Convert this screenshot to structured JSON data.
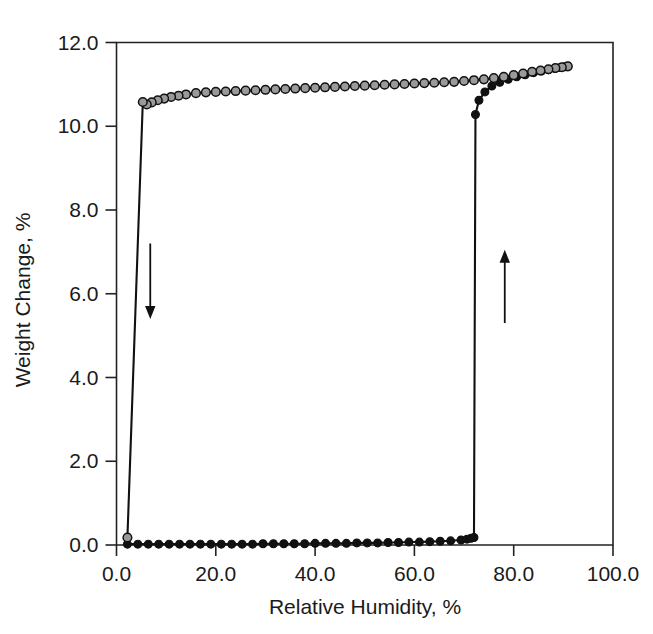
{
  "chart_data": {
    "type": "line",
    "title": "",
    "xlabel": "Relative Humidity, %",
    "ylabel": "Weight Change, %",
    "xlim": [
      0.0,
      100.0
    ],
    "ylim": [
      0.0,
      12.0
    ],
    "xticks": [
      "0.0",
      "20.0",
      "40.0",
      "60.0",
      "80.0",
      "100.0"
    ],
    "xtick_values": [
      0,
      20,
      40,
      60,
      80,
      100
    ],
    "yticks": [
      "0.0",
      "2.0",
      "4.0",
      "6.0",
      "8.0",
      "10.0",
      "12.0"
    ],
    "ytick_values": [
      0,
      2,
      4,
      6,
      8,
      10,
      12
    ],
    "grid": false,
    "legend": "none",
    "series": [
      {
        "name": "Adsorption",
        "marker": "filled-circle",
        "marker_color": "#111111",
        "line_color": "#111111",
        "x": [
          2.2,
          4.3,
          6.4,
          8.5,
          10.6,
          12.7,
          14.8,
          16.9,
          19.0,
          21.1,
          23.2,
          25.3,
          27.4,
          29.5,
          31.6,
          33.7,
          35.8,
          37.9,
          40.0,
          42.1,
          44.2,
          46.3,
          48.4,
          50.5,
          52.6,
          54.7,
          56.8,
          58.9,
          61.0,
          63.1,
          65.2,
          67.3,
          69.4,
          70.6,
          71.4,
          72.0,
          72.3,
          73.0,
          74.2,
          75.6,
          77.2,
          78.9,
          80.6,
          82.3,
          84.0,
          85.6,
          87.0,
          88.3,
          89.4,
          90.3,
          90.9
        ],
        "y": [
          0.02,
          0.02,
          0.02,
          0.02,
          0.02,
          0.02,
          0.02,
          0.02,
          0.02,
          0.02,
          0.02,
          0.02,
          0.02,
          0.03,
          0.03,
          0.03,
          0.03,
          0.03,
          0.04,
          0.04,
          0.04,
          0.04,
          0.05,
          0.05,
          0.05,
          0.06,
          0.06,
          0.07,
          0.07,
          0.08,
          0.09,
          0.1,
          0.12,
          0.14,
          0.16,
          0.18,
          10.28,
          10.62,
          10.82,
          10.96,
          11.05,
          11.12,
          11.18,
          11.23,
          11.28,
          11.32,
          11.35,
          11.38,
          11.4,
          11.42,
          11.43
        ]
      },
      {
        "name": "Desorption",
        "marker": "open-circle",
        "marker_color": "#9a9a9a",
        "line_color": "#111111",
        "x": [
          90.9,
          89.7,
          88.4,
          87.0,
          85.4,
          83.7,
          81.9,
          80.0,
          78.0,
          76.0,
          74.0,
          72.0,
          70.0,
          68.0,
          66.0,
          64.0,
          62.0,
          60.0,
          58.0,
          56.0,
          54.0,
          52.0,
          50.0,
          48.0,
          46.0,
          44.0,
          42.0,
          40.0,
          38.0,
          36.0,
          34.0,
          32.0,
          30.0,
          28.0,
          26.0,
          24.0,
          22.0,
          20.0,
          18.0,
          16.0,
          14.0,
          12.5,
          11.0,
          9.6,
          8.3,
          7.1,
          6.1,
          5.3,
          2.2
        ],
        "y": [
          11.43,
          11.41,
          11.39,
          11.36,
          11.33,
          11.3,
          11.26,
          11.22,
          11.18,
          11.15,
          11.12,
          11.1,
          11.08,
          11.06,
          11.05,
          11.04,
          11.03,
          11.02,
          11.01,
          11.0,
          10.99,
          10.98,
          10.97,
          10.96,
          10.95,
          10.94,
          10.93,
          10.92,
          10.91,
          10.9,
          10.89,
          10.88,
          10.87,
          10.86,
          10.85,
          10.84,
          10.83,
          10.82,
          10.81,
          10.79,
          10.76,
          10.73,
          10.7,
          10.66,
          10.62,
          10.57,
          10.52,
          10.58,
          0.18
        ]
      }
    ],
    "annotations": [
      {
        "name": "desorption-direction-arrow",
        "label": "",
        "direction": "down",
        "x": 6.8,
        "y_start": 7.2,
        "y_end": 5.4
      },
      {
        "name": "adsorption-direction-arrow",
        "label": "",
        "direction": "up",
        "x": 78.2,
        "y_start": 5.3,
        "y_end": 7.05
      }
    ]
  }
}
